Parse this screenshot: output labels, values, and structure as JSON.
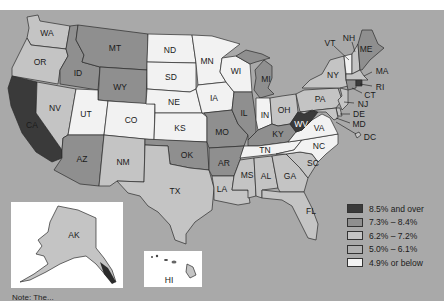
{
  "colors": {
    "background": "#a9a9a9",
    "cat_85_over": "#3a3a3a",
    "cat_73_84": "#8f8f8f",
    "cat_62_72": "#c4c4c4",
    "cat_50_61": "#b0b0b0",
    "cat_49_below": "#f2f2f2"
  },
  "legend": {
    "items": [
      {
        "label": "8.5% and over",
        "color": "#3a3a3a"
      },
      {
        "label": "7.3% – 8.4%",
        "color": "#8f8f8f"
      },
      {
        "label": "6.2% – 7.2%",
        "color": "#c4c4c4"
      },
      {
        "label": "5.0% – 6.1%",
        "color": "#b0b0b0"
      },
      {
        "label": "4.9% or below",
        "color": "#f2f2f2"
      }
    ]
  },
  "states": {
    "WA": "WA",
    "OR": "OR",
    "CA": "CA",
    "NV": "NV",
    "ID": "ID",
    "MT": "MT",
    "WY": "WY",
    "UT": "UT",
    "CO": "CO",
    "AZ": "AZ",
    "NM": "NM",
    "ND": "ND",
    "SD": "SD",
    "NE": "NE",
    "KS": "KS",
    "OK": "OK",
    "TX": "TX",
    "MN": "MN",
    "IA": "IA",
    "MO": "MO",
    "AR": "AR",
    "LA": "LA",
    "WI": "WI",
    "IL": "IL",
    "MI": "MI",
    "IN": "IN",
    "OH": "OH",
    "KY": "KY",
    "TN": "TN",
    "MS": "MS",
    "AL": "AL",
    "GA": "GA",
    "FL": "FL",
    "SC": "SC",
    "NC": "NC",
    "VA": "VA",
    "WV": "WV",
    "PA": "PA",
    "NY": "NY",
    "VT": "VT",
    "NH": "NH",
    "ME": "ME",
    "MA": "MA",
    "RI": "RI",
    "CT": "CT",
    "NJ": "NJ",
    "DE": "DE",
    "MD": "MD",
    "DC": "DC",
    "AK": "AK",
    "HI": "HI"
  },
  "note": "Note: The..."
}
